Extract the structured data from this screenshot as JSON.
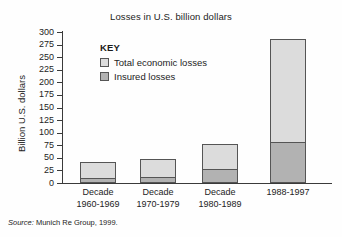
{
  "chart_data": {
    "type": "bar",
    "title": "Losses in U.S. billion dollars",
    "xlabel": "",
    "ylabel": "Billion U.S. dollars",
    "ylim": [
      0,
      300
    ],
    "ytick_labels": [
      "300",
      "275",
      "250",
      "225",
      "200",
      "175",
      "150",
      "125",
      "100",
      "75",
      "50",
      "25",
      "0"
    ],
    "ytick_values": [
      300,
      275,
      250,
      225,
      200,
      175,
      150,
      125,
      100,
      75,
      50,
      25,
      0
    ],
    "grid": false,
    "legend_position": "inside-upper-left",
    "legend_title": "KEY",
    "categories": [
      "Decade 1960-1969",
      "Decade 1970-1979",
      "Decade 1980-1989",
      "1988-1997"
    ],
    "category_lines": [
      [
        "Decade",
        "1960-1969"
      ],
      [
        "Decade",
        "1970-1979"
      ],
      [
        "Decade",
        "1980-1989"
      ],
      [
        "1988-1997"
      ]
    ],
    "series": [
      {
        "name": "Total economic losses",
        "values": [
          42,
          48,
          78,
          286
        ],
        "color": "#dcdcdc"
      },
      {
        "name": "Insured losses",
        "values": [
          10,
          11,
          28,
          82
        ],
        "color": "#b2b2b2"
      }
    ],
    "source": {
      "label": "Source:",
      "text": "Munich Re Group, 1999."
    }
  }
}
